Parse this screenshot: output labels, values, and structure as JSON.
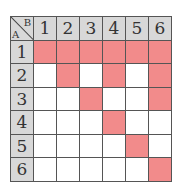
{
  "corner": {
    "col_label": "B",
    "row_label": "A"
  },
  "columns": [
    "1",
    "2",
    "3",
    "4",
    "5",
    "6"
  ],
  "rows": [
    "1",
    "2",
    "3",
    "4",
    "5",
    "6"
  ],
  "highlight_color": "#f28b8b",
  "header_color": "#d8d8d8",
  "highlighted": [
    [
      1,
      1,
      1,
      1,
      1,
      1
    ],
    [
      0,
      1,
      0,
      1,
      0,
      1
    ],
    [
      0,
      0,
      1,
      0,
      0,
      1
    ],
    [
      0,
      0,
      0,
      1,
      0,
      0
    ],
    [
      0,
      0,
      0,
      0,
      1,
      0
    ],
    [
      0,
      0,
      0,
      0,
      0,
      1
    ]
  ]
}
